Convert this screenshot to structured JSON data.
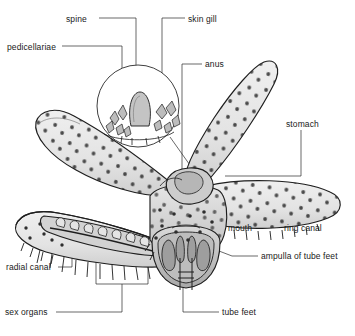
{
  "figure": {
    "view": "cut-away dorsal-lateral diagram with magnified surface inset",
    "background_color": "#ffffff",
    "ink_color": "#1a1a1a",
    "body_fill": "#e9e9e9",
    "body_shade": "#c9c9c9",
    "body_dark": "#9a9a9a",
    "tubercle_color": "#333333"
  },
  "labels": [
    {
      "id": "spine",
      "text": "spine",
      "x": 66,
      "y": 14
    },
    {
      "id": "skin-gill",
      "text": "skin gill",
      "x": 188,
      "y": 14
    },
    {
      "id": "pedicellariae",
      "text": "pedicellariae",
      "x": 7,
      "y": 42
    },
    {
      "id": "anus",
      "text": "anus",
      "x": 205,
      "y": 60
    },
    {
      "id": "stomach",
      "text": "stomach",
      "x": 286,
      "y": 119
    },
    {
      "id": "mouth",
      "text": "mouth",
      "x": 228,
      "y": 224
    },
    {
      "id": "ring-canal",
      "text": "ring canal",
      "x": 284,
      "y": 224
    },
    {
      "id": "ampulla-of-tube-feet",
      "text": "ampulla of tube feet",
      "x": 261,
      "y": 252
    },
    {
      "id": "radial-canal",
      "text": "radial canal",
      "x": 6,
      "y": 264
    },
    {
      "id": "sex-organs",
      "text": "sex organs",
      "x": 5,
      "y": 309
    },
    {
      "id": "tube-feet",
      "text": "tube feet",
      "x": 222,
      "y": 309
    }
  ],
  "leaders": [
    {
      "id": "leader-spine",
      "path": "M 99 18 L 136 18 L 136 78"
    },
    {
      "id": "leader-skin-gill",
      "path": "M 185 18 L 162 18 L 162 82"
    },
    {
      "id": "leader-pedicellariae",
      "path": "M 62 46 L 122 46 L 122 88"
    },
    {
      "id": "leader-anus",
      "path": "M 202 64 L 182 64 L 182 180"
    },
    {
      "id": "leader-stomach",
      "path": "M 301 130 L 301 176 L 225 176"
    },
    {
      "id": "leader-mouth",
      "path": "M 225 228 L 198 228 L 198 206"
    },
    {
      "id": "leader-ring-canal",
      "path": "M 302 222 L 302 200 L 222 200"
    },
    {
      "id": "leader-ampulla",
      "path": "M 258 256 L 236 256 L 220 252"
    },
    {
      "id": "leader-radial-canal",
      "path": "M 58 268 L 72 268 L 72 250"
    },
    {
      "id": "leader-sex-organs",
      "path": "M 56 313 L 122 313 L 122 284 M 122 284 L 96 284 L 96 252 M 122 284 L 148 284 L 148 248"
    },
    {
      "id": "leader-tube-feet",
      "path": "M 219 313 L 183 313 L 183 272"
    }
  ],
  "inset": {
    "id": "magnified-surface-inset",
    "center_x": 138,
    "center_y": 106,
    "radius": 41,
    "contents": [
      "spine",
      "pedicellariae",
      "skin gill"
    ]
  },
  "arms": [
    {
      "id": "arm-upper-left",
      "orientation": "up-left"
    },
    {
      "id": "arm-upper-right",
      "orientation": "up-right"
    },
    {
      "id": "arm-right",
      "orientation": "right"
    },
    {
      "id": "arm-lower-left",
      "orientation": "left-dissected"
    },
    {
      "id": "arm-lower-front",
      "orientation": "front-cutaway"
    }
  ]
}
